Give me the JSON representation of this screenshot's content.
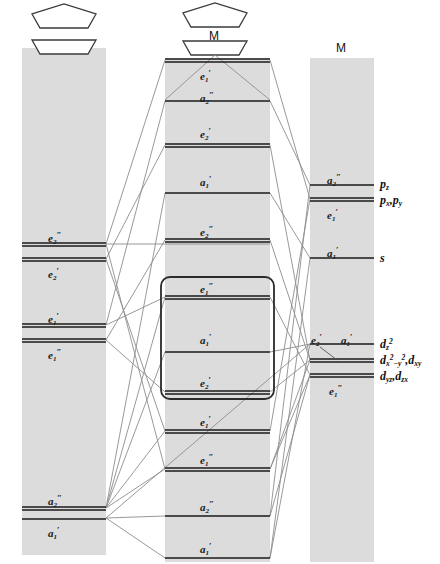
{
  "diagram": {
    "title_center": "M",
    "title_right": "M",
    "columns": {
      "left": {
        "name": "ligand-pi-levels",
        "x": 22,
        "width": 84,
        "top": 48,
        "bottom": 555
      },
      "center": {
        "name": "molecular-orbital-levels",
        "x": 165,
        "width": 105,
        "top": 58,
        "bottom": 562
      },
      "right": {
        "name": "metal-atomic-orbitals",
        "x": 310,
        "width": 64,
        "top": 58,
        "bottom": 562
      }
    },
    "left_levels": [
      {
        "id": "L1",
        "label_base": "e",
        "sub": "2",
        "prime": "″",
        "y": 244,
        "double": true
      },
      {
        "id": "L2",
        "label_base": "e",
        "sub": "2",
        "prime": "′",
        "y": 259,
        "double": true
      },
      {
        "id": "L3",
        "label_base": "e",
        "sub": "1",
        "prime": "′",
        "y": 325,
        "double": true
      },
      {
        "id": "L4",
        "label_base": "e",
        "sub": "1",
        "prime": "″",
        "y": 340,
        "double": true
      },
      {
        "id": "L5",
        "label_base": "a",
        "sub": "2",
        "prime": "″",
        "y": 508,
        "double": true
      },
      {
        "id": "L6",
        "label_base": "a",
        "sub": "1",
        "prime": "′",
        "y": 518,
        "double": true
      }
    ],
    "center_levels": [
      {
        "id": "C1",
        "label_base": "e",
        "sub": "1",
        "prime": "′",
        "y": 60,
        "double": true
      },
      {
        "id": "C2",
        "label_base": "a",
        "sub": "2",
        "prime": "″",
        "y": 101,
        "double": false
      },
      {
        "id": "C3",
        "label_base": "e",
        "sub": "2",
        "prime": "′",
        "y": 145,
        "double": true
      },
      {
        "id": "C4",
        "label_base": "a",
        "sub": "1",
        "prime": "′",
        "y": 193,
        "double": false
      },
      {
        "id": "C5",
        "label_base": "e",
        "sub": "2",
        "prime": "″",
        "y": 240,
        "double": true
      },
      {
        "id": "C6",
        "label_base": "e",
        "sub": "1",
        "prime": "″",
        "y": 297,
        "double": true
      },
      {
        "id": "C7",
        "label_base": "a",
        "sub": "1",
        "prime": "′",
        "y": 352,
        "double": false
      },
      {
        "id": "C8",
        "label_base": "e",
        "sub": "2",
        "prime": "′",
        "y": 392,
        "double": true
      },
      {
        "id": "C9",
        "label_base": "e",
        "sub": "1",
        "prime": "′",
        "y": 431,
        "double": true
      },
      {
        "id": "C10",
        "label_base": "e",
        "sub": "1",
        "prime": "″",
        "y": 469,
        "double": true
      },
      {
        "id": "C11",
        "label_base": "a",
        "sub": "2",
        "prime": "″",
        "y": 516,
        "double": false
      },
      {
        "id": "C12",
        "label_base": "a",
        "sub": "1",
        "prime": "′",
        "y": 558,
        "double": false
      }
    ],
    "highlight_box": {
      "name": "frontier-orbital-box",
      "x": 161,
      "y": 277,
      "width": 113,
      "height": 122
    },
    "right_levels": [
      {
        "id": "R1",
        "label_base": "a",
        "sub": "2",
        "prime": "″",
        "y": 185,
        "double": false,
        "ao": "p_z"
      },
      {
        "id": "R2",
        "label_base": "e",
        "sub": "1",
        "prime": "′",
        "y": 199,
        "double": true,
        "ao": "p_xy"
      },
      {
        "id": "R3",
        "label_base": "a",
        "sub": "1",
        "prime": "′",
        "y": 258,
        "double": false,
        "ao": "s"
      },
      {
        "id": "R4",
        "label_base": "a",
        "sub": "1",
        "prime": "′",
        "y": 344,
        "double": false,
        "ao": "d_z2"
      },
      {
        "id": "R5",
        "label_base": "e",
        "sub": "2",
        "prime": "′",
        "y": 360,
        "double": true,
        "ao": "d_x2y2_xy"
      },
      {
        "id": "R6",
        "label_base": "e",
        "sub": "1",
        "prime": "″",
        "y": 375,
        "double": true,
        "ao": "d_yz_zx"
      }
    ],
    "ao_labels": [
      {
        "id": "AO1",
        "text": "p",
        "sub": "z",
        "y": 180
      },
      {
        "id": "AO2",
        "text": "p",
        "sub": "x",
        "text2": ",p",
        "sub2": "y",
        "y": 196
      },
      {
        "id": "AO3",
        "text": "s",
        "sub": "",
        "y": 255
      },
      {
        "id": "AO4",
        "text": "d",
        "sub": "z2",
        "y": 340
      },
      {
        "id": "AO5",
        "text": "d",
        "sub": "x2-y2",
        "text2": ",d",
        "sub2": "xy",
        "y": 357
      },
      {
        "id": "AO6",
        "text": "d",
        "sub": "yz",
        "text2": ",d",
        "sub2": "zx",
        "y": 373
      }
    ],
    "ao_label_text": {
      "pz": "pz",
      "pxpy": "px,py",
      "s": "s",
      "dz2": "dz2",
      "dx2y2dxy": "dx2-y2,dxy",
      "dyzdzx": "dyz,dzx"
    },
    "rings": {
      "left_top": {
        "name": "cyclopentadienyl-ring-upper",
        "cx": 64,
        "cy": 23
      },
      "left_bottom": {
        "name": "cyclopentadienyl-ring-lower",
        "cx": 64,
        "cy": 48
      },
      "center_top": {
        "name": "cyclopentadienyl-ring-upper",
        "cx": 215,
        "cy": 22
      },
      "center_bottom": {
        "name": "cyclopentadienyl-ring-lower",
        "cx": 215,
        "cy": 49
      }
    },
    "colors": {
      "band": "#dcdcdc",
      "level_line": "#1a1a1a",
      "correlation_line": "#8a8a8a",
      "box_outline": "#2b2b2b",
      "text": "#111111"
    }
  },
  "secondary_label_e2prime": {
    "base": "e",
    "sub": "2",
    "prime": "′"
  }
}
